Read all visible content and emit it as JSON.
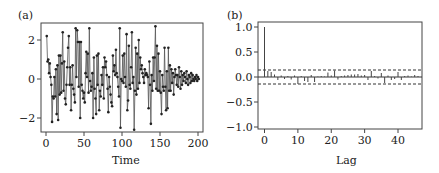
{
  "figure": {
    "panels": [
      {
        "id": "a",
        "label": "(a)"
      },
      {
        "id": "b",
        "label": "(b)"
      }
    ]
  },
  "chart_data": [
    {
      "panel": "(a)",
      "type": "line",
      "title": "",
      "xlabel": "Time",
      "ylabel": "",
      "xlim": [
        0,
        200
      ],
      "ylim": [
        -2.7,
        2.7
      ],
      "xticks": [
        0,
        50,
        100,
        150,
        200
      ],
      "yticks": [
        -2,
        0,
        2
      ],
      "markers": true,
      "grid": false,
      "x_start": 1,
      "values": [
        2.2,
        0.9,
        1.0,
        0.3,
        0.8,
        0.1,
        -0.3,
        -2.2,
        -0.9,
        -1.0,
        0.1,
        -0.9,
        0.5,
        -1.8,
        0.7,
        -2.1,
        1.2,
        -0.8,
        1.2,
        -0.7,
        0.8,
        2.4,
        -0.6,
        0.9,
        -1.0,
        -1.3,
        -0.3,
        0.6,
        1.6,
        2.2,
        -0.3,
        0.6,
        -1.6,
        -0.3,
        0.7,
        -0.5,
        -0.8,
        -1.2,
        2.6,
        0.1,
        2.5,
        1.9,
        -0.4,
        1.9,
        -2.0,
        1.9,
        -0.3,
        -0.6,
        -1.0,
        -0.7,
        -1.2,
        0.3,
        1.4,
        0.1,
        1.3,
        -0.7,
        2.6,
        -0.1,
        -0.6,
        -0.4,
        0.3,
        -2.0,
        1.1,
        -0.5,
        -1.0,
        -1.8,
        1.2,
        -0.3,
        1.3,
        -1.6,
        -0.6,
        -0.9,
        0.2,
        -0.3,
        0.6,
        -1.0,
        1.1,
        0.6,
        0.9,
        0.2,
        -0.5,
        -1.7,
        0.1,
        -0.4,
        -0.8,
        -1.2,
        -1.4,
        1.2,
        0.4,
        0.7,
        0.2,
        1.5,
        0.3,
        0.1,
        -0.4,
        -0.9,
        2.6,
        -2.5,
        0.0,
        -0.1,
        1.2,
        -0.2,
        1.3,
        0.1,
        -0.4,
        2.3,
        -1.6,
        -1.1,
        1.7,
        -0.3,
        -0.5,
        0.6,
        2.4,
        -0.2,
        0.1,
        -2.6,
        -0.6,
        1.6,
        -0.8,
        1.3,
        -0.5,
        2.0,
        -0.2,
        1.1,
        0.5,
        0.7,
        0.3,
        0.1,
        -0.2,
        0.5,
        0.2,
        0.3,
        0.2,
        0.1,
        -1.5,
        0.9,
        -0.3,
        -2.3,
        0.2,
        -0.6,
        1.1,
        -0.1,
        1.1,
        2.7,
        -0.5,
        1.7,
        -0.6,
        1.3,
        -0.6,
        0.4,
        -0.7,
        -1.8,
        0.2,
        -0.4,
        -0.6,
        1.6,
        -0.4,
        -1.6,
        0.4,
        -1.5,
        1.6,
        -0.6,
        0.7,
        -0.6,
        0.5,
        -0.2,
        0.3,
        -0.8,
        0.1,
        0.5,
        0.2,
        -0.3,
        0.2,
        -0.4,
        0.6,
        0.1,
        -0.5,
        0.4,
        -0.3,
        0.2,
        -0.1,
        0.3,
        0.1,
        -0.2,
        0.4,
        0.0,
        -0.3,
        0.2,
        0.1,
        -0.2,
        0.3,
        -0.1,
        0.2,
        0.0,
        -0.1,
        0.1,
        0.0,
        0.2,
        -0.1,
        0.1,
        0.0
      ]
    },
    {
      "panel": "(b)",
      "type": "bar",
      "subtype": "acf",
      "title": "",
      "xlabel": "Lag",
      "ylabel": "",
      "xlim": [
        -2,
        47
      ],
      "ylim": [
        -1.0,
        1.0
      ],
      "xticks": [
        0,
        10,
        20,
        30,
        40
      ],
      "yticks": [
        -1.0,
        -0.5,
        0.0,
        0.5,
        1.0
      ],
      "grid": false,
      "confidence_band": 0.14,
      "confidence_style": "dashed",
      "lags": [
        0,
        1,
        2,
        3,
        4,
        5,
        6,
        7,
        8,
        9,
        10,
        11,
        12,
        13,
        14,
        15,
        16,
        17,
        18,
        19,
        20,
        21,
        22,
        23,
        24,
        25,
        26,
        27,
        28,
        29,
        30,
        31,
        32,
        33,
        34,
        35,
        36,
        37,
        38,
        39,
        40,
        41,
        42,
        43,
        44,
        45,
        46
      ],
      "values": [
        1.0,
        0.12,
        0.1,
        0.05,
        -0.06,
        0.03,
        -0.04,
        0.02,
        -0.05,
        0.03,
        -0.14,
        0.02,
        -0.08,
        -0.1,
        0.04,
        -0.1,
        0.01,
        0.02,
        0.01,
        0.09,
        0.03,
        0.13,
        -0.05,
        0.02,
        0.03,
        0.04,
        0.05,
        0.05,
        0.06,
        0.03,
        0.04,
        -0.06,
        0.12,
        0.02,
        -0.03,
        0.08,
        -0.12,
        0.03,
        -0.06,
        -0.04,
        0.1,
        -0.06,
        0.02,
        0.03,
        0.01,
        0.04,
        0.02
      ]
    }
  ]
}
